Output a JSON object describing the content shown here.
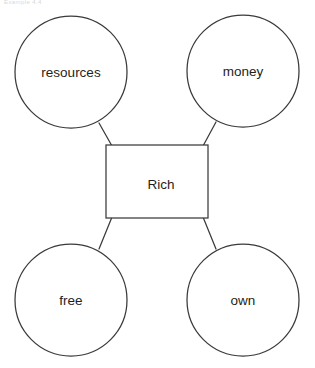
{
  "page": {
    "header_caption": "Example 4.4",
    "width": 315,
    "height": 368,
    "background_color": "#ffffff"
  },
  "diagram": {
    "type": "word-web",
    "stroke_color": "#3a3a3c",
    "text_color": "#231f20",
    "fill_color": "#ffffff",
    "center": {
      "label": "Rich",
      "shape": "rectangle",
      "x": 106,
      "y": 145,
      "width": 102,
      "height": 73,
      "label_x": 161,
      "label_y": 185
    },
    "nodes": [
      {
        "label": "resources",
        "shape": "circle",
        "cx": 71,
        "cy": 72,
        "r": 56,
        "position": "top-left"
      },
      {
        "label": "money",
        "shape": "circle",
        "cx": 243,
        "cy": 71,
        "r": 56,
        "position": "top-right"
      },
      {
        "label": "free",
        "shape": "circle",
        "cx": 71,
        "cy": 300,
        "r": 56,
        "position": "bottom-left"
      },
      {
        "label": "own",
        "shape": "circle",
        "cx": 243,
        "cy": 300,
        "r": 56,
        "position": "bottom-right"
      }
    ],
    "connectors": [
      {
        "from": "resources",
        "to": "Rich",
        "x1": 99,
        "y1": 123,
        "x2": 112,
        "y2": 146
      },
      {
        "from": "money",
        "to": "Rich",
        "x1": 216,
        "y1": 122,
        "x2": 203,
        "y2": 146
      },
      {
        "from": "free",
        "to": "Rich",
        "x1": 99,
        "y1": 249,
        "x2": 112,
        "y2": 217
      },
      {
        "from": "own",
        "to": "Rich",
        "x1": 216,
        "y1": 249,
        "x2": 203,
        "y2": 217
      }
    ]
  }
}
